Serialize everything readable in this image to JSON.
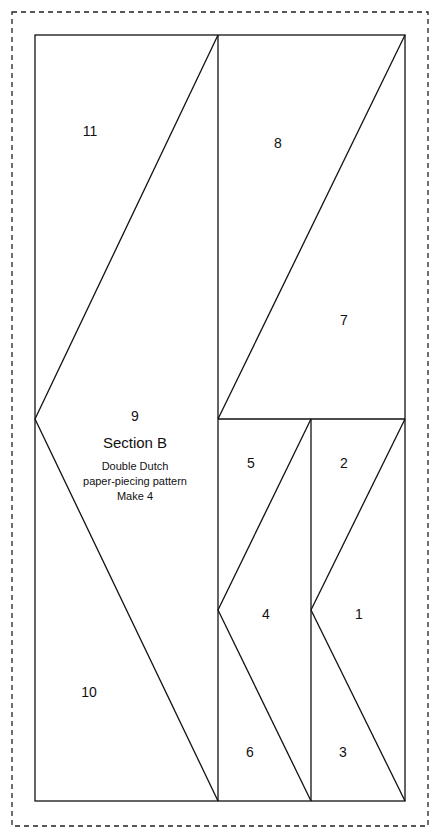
{
  "pattern": {
    "section_title": "Section B",
    "subtitle_lines": [
      "Double Dutch",
      "paper-piecing pattern",
      "Make 4"
    ],
    "line_color": "#111111",
    "cut_line_style": "dashed",
    "pieces": [
      {
        "id": "1",
        "label": "1"
      },
      {
        "id": "2",
        "label": "2"
      },
      {
        "id": "3",
        "label": "3"
      },
      {
        "id": "4",
        "label": "4"
      },
      {
        "id": "5",
        "label": "5"
      },
      {
        "id": "6",
        "label": "6"
      },
      {
        "id": "7",
        "label": "7"
      },
      {
        "id": "8",
        "label": "8"
      },
      {
        "id": "9",
        "label": "9"
      },
      {
        "id": "10",
        "label": "10"
      },
      {
        "id": "11",
        "label": "11"
      }
    ]
  }
}
